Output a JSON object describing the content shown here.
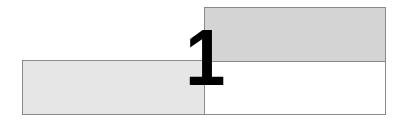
{
  "figure": {
    "numeral": "1",
    "panels": [
      {
        "name": "left-panel",
        "fill": "#e6e6e6"
      },
      {
        "name": "right-top-panel",
        "fill": "#d4d4d4"
      },
      {
        "name": "right-bottom-panel",
        "fill": "#ffffff"
      }
    ],
    "border_color": "#8a8a8a"
  }
}
